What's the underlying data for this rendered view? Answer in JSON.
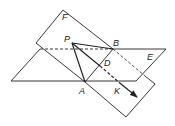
{
  "diagram": {
    "stroke_color": "#222222",
    "labels": {
      "F": "F",
      "P": "P",
      "B": "B",
      "E": "E",
      "D": "D",
      "A": "A",
      "K": "K"
    },
    "points": {
      "P": [
        72,
        43
      ],
      "B": [
        113,
        49
      ],
      "A": [
        85,
        82
      ],
      "D": [
        100,
        66
      ],
      "K": [
        120,
        83
      ],
      "arrow_tip": [
        137,
        97
      ]
    },
    "plane_F": [
      [
        63,
        10
      ],
      [
        36,
        43
      ],
      [
        126,
        117
      ],
      [
        155,
        84
      ]
    ],
    "plane_E": [
      [
        11,
        81
      ],
      [
        40,
        49
      ],
      [
        166,
        49
      ],
      [
        136,
        81
      ]
    ]
  }
}
